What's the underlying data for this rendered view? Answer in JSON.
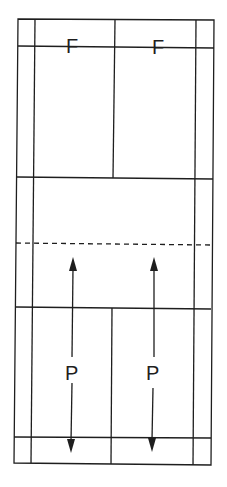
{
  "diagram": {
    "type": "badminton-court-doubles-service",
    "colors": {
      "line": "#1e1e1e",
      "background": "#ffffff"
    },
    "labels": {
      "f_left": "F",
      "f_right": "F",
      "p_left": "P",
      "p_right": "P"
    }
  }
}
